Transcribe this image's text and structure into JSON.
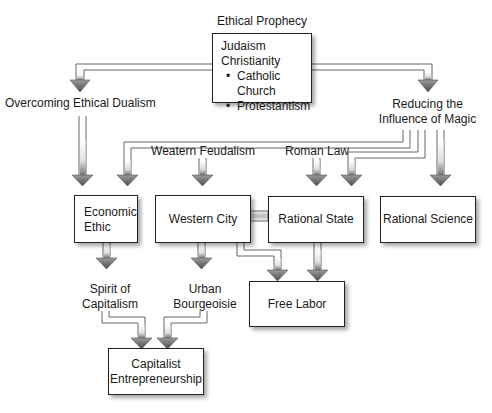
{
  "diagram": {
    "top_label": "Ethical Prophecy",
    "religion_box": {
      "lines": [
        "Judaism",
        "Christianity"
      ],
      "bullets": [
        "Catholic Church",
        "Protestantism"
      ]
    },
    "left_branch_label": "Overcoming Ethical Dualism",
    "right_branch_label_line1": "Reducing the",
    "right_branch_label_line2": "Influence of Magic",
    "western_feudalism": "Weatern Feudalism",
    "roman_law": "Roman Law",
    "economic_ethic_line1": "Economic",
    "economic_ethic_line2": "Ethic",
    "western_city": "Western City",
    "rational_state": "Rational State",
    "rational_science": "Rational Science",
    "spirit_line1": "Spirit of",
    "spirit_line2": "Capitalism",
    "urban_line1": "Urban",
    "urban_line2": "Bourgeoisie",
    "free_labor": "Free Labor",
    "capitalist_line1": "Capitalist",
    "capitalist_line2": "Entrepreneurship"
  },
  "colors": {
    "arrow_fill": "#6e6e6e",
    "arrow_outline": "#555555",
    "box_border": "#222222",
    "background": "#ffffff"
  }
}
